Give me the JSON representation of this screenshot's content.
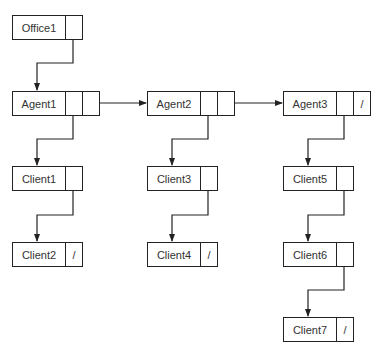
{
  "diagram": {
    "type": "linked-list-of-lists",
    "nodes": [
      {
        "id": "office1",
        "label": "Office1",
        "x": 12,
        "y": 15,
        "pointers": [
          ""
        ]
      },
      {
        "id": "agent1",
        "label": "Agent1",
        "x": 12,
        "y": 91,
        "pointers": [
          "",
          ""
        ]
      },
      {
        "id": "agent2",
        "label": "Agent2",
        "x": 147,
        "y": 91,
        "pointers": [
          "",
          ""
        ]
      },
      {
        "id": "agent3",
        "label": "Agent3",
        "x": 283,
        "y": 91,
        "pointers": [
          "",
          "/"
        ]
      },
      {
        "id": "client1",
        "label": "Client1",
        "x": 12,
        "y": 166,
        "pointers": [
          ""
        ]
      },
      {
        "id": "client2",
        "label": "Client2",
        "x": 12,
        "y": 242,
        "pointers": [
          "/"
        ]
      },
      {
        "id": "client3",
        "label": "Client3",
        "x": 147,
        "y": 166,
        "pointers": [
          ""
        ]
      },
      {
        "id": "client4",
        "label": "Client4",
        "x": 147,
        "y": 242,
        "pointers": [
          "/"
        ]
      },
      {
        "id": "client5",
        "label": "Client5",
        "x": 283,
        "y": 166,
        "pointers": [
          ""
        ]
      },
      {
        "id": "client6",
        "label": "Client6",
        "x": 283,
        "y": 242,
        "pointers": [
          ""
        ]
      },
      {
        "id": "client7",
        "label": "Client7",
        "x": 283,
        "y": 317,
        "pointers": [
          "/"
        ]
      }
    ],
    "edges": [
      {
        "from": "office1",
        "to": "agent1"
      },
      {
        "from": "agent1",
        "to": "agent2"
      },
      {
        "from": "agent2",
        "to": "agent3"
      },
      {
        "from": "agent1",
        "to": "client1"
      },
      {
        "from": "client1",
        "to": "client2"
      },
      {
        "from": "agent2",
        "to": "client3"
      },
      {
        "from": "client3",
        "to": "client4"
      },
      {
        "from": "agent3",
        "to": "client5"
      },
      {
        "from": "client5",
        "to": "client6"
      },
      {
        "from": "client6",
        "to": "client7"
      }
    ],
    "colors": {
      "stroke": "#222222",
      "text": "#333333",
      "background": "#ffffff"
    }
  }
}
